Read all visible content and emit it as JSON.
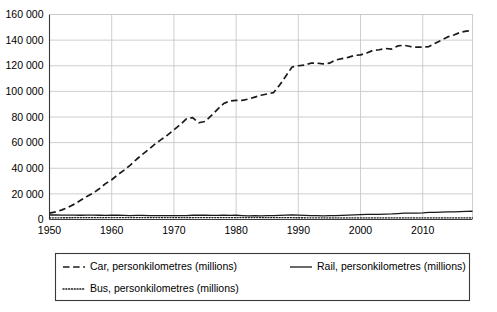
{
  "chart_data": {
    "type": "line",
    "title": "",
    "subtitle": "",
    "xlabel": "",
    "ylabel": "",
    "xlim": [
      1950,
      2018
    ],
    "ylim": [
      0,
      160000
    ],
    "grid": true,
    "legend_position": "bottom",
    "y_ticks": [
      0,
      20000,
      40000,
      60000,
      80000,
      100000,
      120000,
      140000,
      160000
    ],
    "y_tick_labels": [
      "0",
      "20 000",
      "40 000",
      "60 000",
      "80 000",
      "100 000",
      "120 000",
      "140 000",
      "160 000"
    ],
    "x_ticks": [
      1950,
      1960,
      1970,
      1980,
      1990,
      2000,
      2010
    ],
    "x_tick_labels": [
      "1950",
      "1960",
      "1970",
      "1980",
      "1990",
      "2000",
      "2010"
    ],
    "x": [
      1950,
      1951,
      1952,
      1953,
      1954,
      1955,
      1956,
      1957,
      1958,
      1959,
      1960,
      1961,
      1962,
      1963,
      1964,
      1965,
      1966,
      1967,
      1968,
      1969,
      1970,
      1971,
      1972,
      1973,
      1974,
      1975,
      1976,
      1977,
      1978,
      1979,
      1980,
      1981,
      1982,
      1983,
      1984,
      1985,
      1986,
      1987,
      1988,
      1989,
      1990,
      1991,
      1992,
      1993,
      1994,
      1995,
      1996,
      1997,
      1998,
      1999,
      2000,
      2001,
      2002,
      2003,
      2004,
      2005,
      2006,
      2007,
      2008,
      2009,
      2010,
      2011,
      2012,
      2013,
      2014,
      2015,
      2016,
      2017,
      2018
    ],
    "series": [
      {
        "name": "Car, personkilometres (millions)",
        "key": "car",
        "style": "dashed",
        "color": "#1a1a1a",
        "values": [
          5000,
          6000,
          7500,
          9500,
          12000,
          15000,
          18000,
          20500,
          24000,
          28000,
          31000,
          35000,
          38500,
          42500,
          47000,
          51000,
          55000,
          59000,
          62500,
          66000,
          70000,
          74000,
          78500,
          79500,
          75500,
          76500,
          81000,
          86000,
          90500,
          92500,
          93000,
          93000,
          94000,
          95500,
          97000,
          98000,
          99000,
          105000,
          112000,
          119000,
          120000,
          120500,
          122000,
          122000,
          121500,
          122000,
          124500,
          125500,
          126500,
          128000,
          128500,
          130000,
          132000,
          132500,
          133500,
          133000,
          135500,
          136000,
          135000,
          134500,
          134500,
          135000,
          137500,
          140000,
          142500,
          144000,
          146000,
          147000,
          147500
        ]
      },
      {
        "name": "Rail, personkilometres (millions)",
        "key": "rail",
        "style": "solid",
        "color": "#1a1a1a",
        "values": [
          3500,
          3500,
          3450,
          3450,
          3450,
          3300,
          3400,
          3400,
          3300,
          3250,
          3300,
          3300,
          3200,
          3100,
          3200,
          3150,
          3100,
          3050,
          3000,
          3000,
          3000,
          3100,
          3100,
          3300,
          3400,
          3300,
          3250,
          3200,
          3300,
          3200,
          3300,
          3100,
          2800,
          3000,
          2900,
          3000,
          3050,
          3200,
          3400,
          3500,
          3350,
          3200,
          3100,
          3000,
          2900,
          3000,
          3050,
          3200,
          3400,
          3550,
          3800,
          3950,
          4000,
          4050,
          4250,
          4350,
          4600,
          4900,
          5000,
          5000,
          5200,
          5500,
          5600,
          5750,
          5900,
          6000,
          6200,
          6400,
          6450
        ]
      },
      {
        "name": "Bus, personkilometres (millions)",
        "key": "bus",
        "style": "dotted",
        "color": "#1a1a1a",
        "values": [
          1300,
          1300,
          1350,
          1350,
          1400,
          1400,
          1450,
          1450,
          1400,
          1450,
          1500,
          1500,
          1500,
          1500,
          1500,
          1500,
          1500,
          1500,
          1500,
          1500,
          1500,
          1450,
          1450,
          1450,
          1500,
          1500,
          1500,
          1500,
          1500,
          1500,
          1500,
          1500,
          1500,
          1500,
          1450,
          1400,
          1400,
          1400,
          1400,
          1400,
          1350,
          1350,
          1300,
          1300,
          1250,
          1250,
          1250,
          1250,
          1250,
          1250,
          1250,
          1250,
          1250,
          1250,
          1250,
          1250,
          1250,
          1250,
          1250,
          1250,
          1250,
          1250,
          1250,
          1250,
          1250,
          1250,
          1250,
          1250,
          1250
        ]
      }
    ]
  },
  "legend": {
    "entries": [
      {
        "label": "Car, personkilometres (millions)",
        "style": "dashed"
      },
      {
        "label": "Rail, personkilometres (millions)",
        "style": "solid"
      },
      {
        "label": "Bus, personkilometres (millions)",
        "style": "dotted"
      }
    ]
  },
  "colors": {
    "axis": "#3a3a3a",
    "gridline": "#c8c8c8",
    "line": "#1a1a1a",
    "legend_border": "#3a3a3a",
    "background": "#ffffff"
  }
}
